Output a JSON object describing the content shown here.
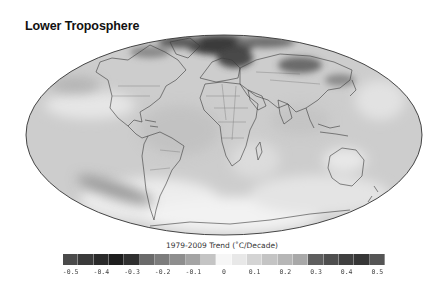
{
  "title": "Lower Troposphere",
  "map": {
    "projection": "mollweide",
    "background_gray": "#c9c9c9",
    "outline_color": "#333333",
    "coast_color": "#3a3a3a"
  },
  "colorbar": {
    "label": "1979-2009 Trend (˚C/Decade)",
    "min": -0.5,
    "max": 0.5,
    "segments": [
      "#4a4a4a",
      "#3a3a3a",
      "#2a2a2a",
      "#1e1e1e",
      "#303030",
      "#6a6a6a",
      "#7c7c7c",
      "#8e8e8e",
      "#a4a4a4",
      "#c4c4c4",
      "#f6f6f6",
      "#e8e8e8",
      "#d4d4d4",
      "#c4c4c4",
      "#b6b6b6",
      "#a8a8a8",
      "#5e5e5e",
      "#4e4e4e",
      "#404040",
      "#363636",
      "#555555"
    ],
    "ticks": [
      "-0.5",
      "-0.4",
      "-0.3",
      "-0.2",
      "-0.1",
      "0",
      "0.1",
      "0.2",
      "0.3",
      "0.4",
      "0.5"
    ]
  }
}
